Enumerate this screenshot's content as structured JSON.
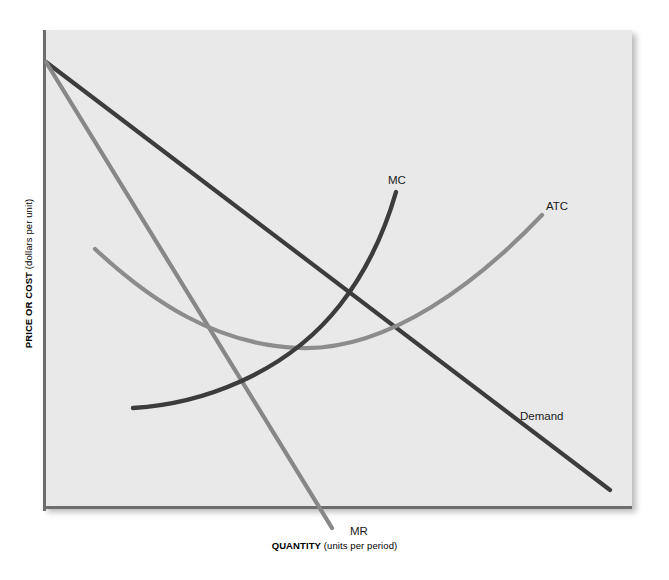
{
  "figure": {
    "name": "monopoly-cost-and-revenue-diagram",
    "background_color": "#ffffff",
    "plot_background_color": "#e9e9e9",
    "axis_color": "#6d6d6d"
  },
  "axes": {
    "y": {
      "title_bold": "PRICE OR COST",
      "title_plain": " (dollars per unit)",
      "full": "PRICE OR COST (dollars per unit)"
    },
    "x": {
      "title_bold": "QUANTITY",
      "title_plain": " (units per period)",
      "full": "QUANTITY (units per period)"
    }
  },
  "curve_labels": {
    "mc": "MC",
    "atc": "ATC",
    "demand": "Demand",
    "mr": "MR"
  },
  "chart_data": {
    "type": "line",
    "title": "",
    "xlabel": "QUANTITY (units per period)",
    "ylabel": "PRICE OR COST (dollars per unit)",
    "grid": false,
    "legend": "inline-curve-labels",
    "axis_ranges": {
      "x": [
        0,
        100
      ],
      "y": [
        0,
        100
      ]
    },
    "colors": {
      "demand": "#3c3c3c",
      "mc": "#3c3c3c",
      "mr": "#878787",
      "atc": "#8c8c8c"
    },
    "series": [
      {
        "name": "Demand",
        "label": "Demand",
        "color": "#3c3c3c",
        "shape": "straight downward-sloping line",
        "points": [
          [
            0,
            93
          ],
          [
            100,
            4
          ]
        ],
        "pixel_path": "M 46 62 L 610 490"
      },
      {
        "name": "MR",
        "label": "MR",
        "color": "#878787",
        "shape": "straight downward-sloping line, twice the slope of demand",
        "points": [
          [
            0,
            93
          ],
          [
            50,
            2
          ]
        ],
        "pixel_path": "M 46 62 L 332 528"
      },
      {
        "name": "MC",
        "label": "MC",
        "color": "#3c3c3c",
        "shape": "upward sweeping marginal cost curve",
        "points": [
          [
            16,
            21
          ],
          [
            28,
            24
          ],
          [
            40,
            36
          ],
          [
            50,
            52
          ],
          [
            62,
            66
          ]
        ],
        "pixel_path": "M 133 408 C 200 404, 285 375, 340 305 C 372 264, 388 220, 396 192"
      },
      {
        "name": "ATC",
        "label": "ATC",
        "color": "#8c8c8c",
        "shape": "U-shaped average total cost curve",
        "points": [
          [
            9,
            54
          ],
          [
            20,
            38
          ],
          [
            32,
            33
          ],
          [
            45,
            34
          ],
          [
            60,
            42
          ],
          [
            74,
            52
          ],
          [
            85,
            61
          ]
        ],
        "pixel_path": "M 95 249 C 150 300, 215 345, 300 348 C 390 351, 480 280, 542 215"
      }
    ],
    "intersections": [
      {
        "label": "MC crosses MR",
        "pixel": [
          272,
          356
        ]
      },
      {
        "label": "MC crosses ATC",
        "pixel": [
          345,
          302
        ]
      },
      {
        "label": "MR crosses ATC",
        "pixel": [
          224,
          339
        ]
      },
      {
        "label": "Demand crosses ATC",
        "pixel": [
          394,
          300
        ]
      },
      {
        "label": "Demand crosses MC",
        "pixel": [
          349,
          301
        ]
      }
    ]
  }
}
